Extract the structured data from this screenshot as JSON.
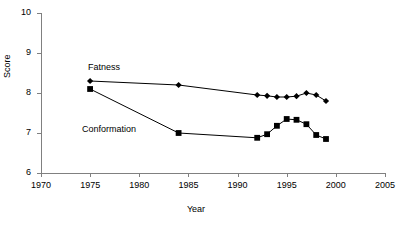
{
  "chart_data": {
    "type": "line",
    "title": "",
    "xlabel": "Year",
    "ylabel": "Score",
    "xlim": [
      1970,
      2005
    ],
    "ylim": [
      6,
      10
    ],
    "xticks": [
      1970,
      1975,
      1980,
      1985,
      1990,
      1995,
      2000,
      2005
    ],
    "yticks": [
      6,
      7,
      8,
      9,
      10
    ],
    "grid": false,
    "legend_position": "inline-annotations",
    "annotations": [
      {
        "text": "Fatness",
        "x": 1975,
        "y": 8.6
      },
      {
        "text": "Conformation",
        "x": 1975,
        "y": 7.15
      }
    ],
    "series": [
      {
        "name": "Fatness",
        "marker": "diamond",
        "color": "#000000",
        "x": [
          1975,
          1984,
          1992,
          1993,
          1994,
          1995,
          1996,
          1997,
          1998,
          1999
        ],
        "values": [
          8.3,
          8.2,
          7.95,
          7.93,
          7.9,
          7.9,
          7.92,
          8.0,
          7.95,
          7.8
        ]
      },
      {
        "name": "Conformation",
        "marker": "square",
        "color": "#000000",
        "x": [
          1975,
          1984,
          1992,
          1993,
          1994,
          1995,
          1996,
          1997,
          1998,
          1999
        ],
        "values": [
          8.1,
          7.0,
          6.88,
          6.97,
          7.18,
          7.35,
          7.33,
          7.22,
          6.95,
          6.85
        ]
      }
    ]
  },
  "axes": {
    "y_tick_labels": [
      "10",
      "9",
      "8",
      "7",
      "6"
    ],
    "x_tick_labels": [
      "1970",
      "1975",
      "1980",
      "1985",
      "1990",
      "1995",
      "2000",
      "2005"
    ],
    "y_axis_title": "Score",
    "x_axis_title": "Year"
  },
  "labels": {
    "fatness": "Fatness",
    "conformation": "Conformation"
  },
  "colors": {
    "axis": "#808080",
    "line": "#000000",
    "marker": "#000000",
    "text": "#000000",
    "background": "#ffffff"
  }
}
